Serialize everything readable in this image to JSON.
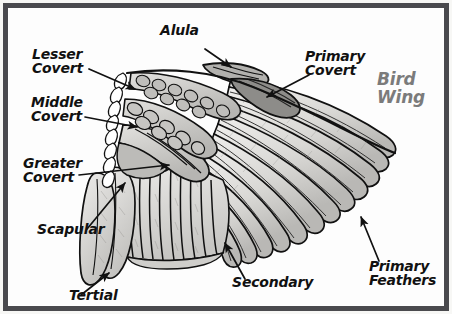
{
  "figure": {
    "title": "Bird\nWing",
    "title_color": "#7b7b7b",
    "frame_color": "#4a4a4e",
    "background_color": "#fdfdfd"
  },
  "labels": [
    {
      "id": "alula",
      "text": "Alula",
      "x": 168,
      "y": 12,
      "lines": 1
    },
    {
      "id": "lesser-covert",
      "text": "Lesser\nCovert",
      "x": 40,
      "y": 36,
      "lines": 2
    },
    {
      "id": "primary-covert",
      "text": "Primary\nCovert",
      "x": 296,
      "y": 38,
      "lines": 2
    },
    {
      "id": "middle-covert",
      "text": "Middle\nCovert",
      "x": 38,
      "y": 84,
      "lines": 2
    },
    {
      "id": "greater-covert",
      "text": "Greater\nCovert",
      "x": 30,
      "y": 145,
      "lines": 2
    },
    {
      "id": "scapular",
      "text": "Scapular",
      "x": 44,
      "y": 217,
      "lines": 1
    },
    {
      "id": "tertial",
      "text": "Tertial",
      "x": 76,
      "y": 281,
      "lines": 1
    },
    {
      "id": "secondary",
      "text": "Secondary",
      "x": 228,
      "y": 267,
      "lines": 1
    },
    {
      "id": "primary-feathers",
      "text": "Primary\nFeathers",
      "x": 364,
      "y": 250,
      "lines": 2
    }
  ],
  "title_position": {
    "x": 379,
    "y": 63
  },
  "colors": {
    "ink": "#111111",
    "feather_light": "#f2f1ef",
    "feather_mid": "#d4d3d0",
    "feather_dark": "#a9a8a5",
    "covert_fill": "#c9c8c5"
  }
}
